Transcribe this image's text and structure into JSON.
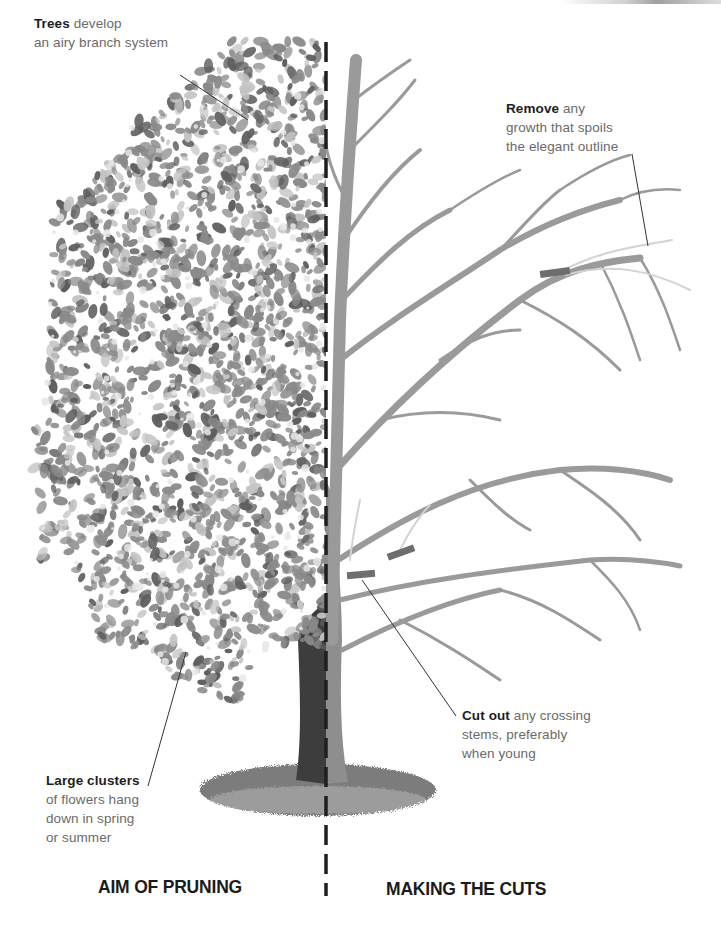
{
  "diagram": {
    "theme_colors": {
      "foliage": "#8a8a8a",
      "foliage_dark": "#5e5e5e",
      "foliage_light": "#c4c4c4",
      "branch": "#9a9a9a",
      "branch_removed": "#d2d2d2",
      "cut_mark": "#6e6e6e",
      "trunk_left": "#3d3d3d",
      "trunk_right": "#8e8e8e",
      "ground": "#7c7c7c",
      "divider": "#1e1e1e",
      "leader_line": "#333333"
    },
    "sections": [
      {
        "id": "left",
        "heading": "AIM OF PRUNING"
      },
      {
        "id": "right",
        "heading": "MAKING THE CUTS"
      }
    ],
    "annotations": [
      {
        "id": "trees",
        "bold": "Trees",
        "text_lines": [
          " develop",
          "an airy branch system"
        ]
      },
      {
        "id": "remove",
        "bold": "Remove",
        "text_lines": [
          " any",
          "growth that spoils",
          "the elegant outline"
        ]
      },
      {
        "id": "cut-out",
        "bold": "Cut out",
        "text_lines": [
          " any crossing",
          "stems, preferably",
          "when young"
        ]
      },
      {
        "id": "clusters",
        "bold": "Large clusters",
        "text_lines": [
          "",
          "of flowers hang",
          "down in spring",
          "or summer"
        ]
      }
    ]
  }
}
